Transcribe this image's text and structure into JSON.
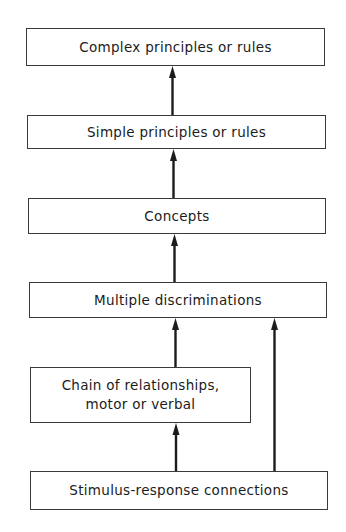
{
  "diagram": {
    "type": "hierarchy-flowchart",
    "direction": "bottom-to-top",
    "nodes": [
      {
        "id": "complex",
        "label": "Complex principles or rules"
      },
      {
        "id": "simple",
        "label": "Simple principles or rules"
      },
      {
        "id": "concepts",
        "label": "Concepts"
      },
      {
        "id": "multiple",
        "label": "Multiple discriminations"
      },
      {
        "id": "chain",
        "label": "Chain of relationships,\nmotor or verbal"
      },
      {
        "id": "stimulus",
        "label": "Stimulus-response connections"
      }
    ],
    "edges": [
      {
        "from": "simple",
        "to": "complex"
      },
      {
        "from": "concepts",
        "to": "simple"
      },
      {
        "from": "multiple",
        "to": "concepts"
      },
      {
        "from": "chain",
        "to": "multiple"
      },
      {
        "from": "stimulus",
        "to": "chain"
      },
      {
        "from": "stimulus",
        "to": "multiple"
      }
    ],
    "colors": {
      "line": "#1c1c1c",
      "border": "#3a3a3a",
      "background": "#ffffff"
    }
  }
}
